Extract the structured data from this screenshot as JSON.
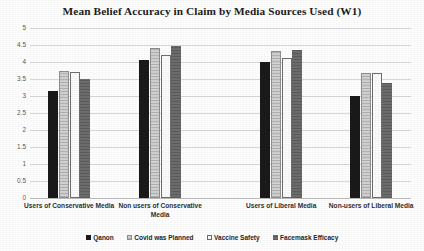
{
  "chart_data": {
    "type": "bar",
    "title": "Mean Belief Accuracy in Claim by Media Sources Used (W1)",
    "xlabel": "",
    "ylabel": "",
    "ylim": [
      0,
      5
    ],
    "ytick_labels": [
      "5",
      "4.5",
      "4",
      "3.5",
      "3",
      "2.5",
      "2",
      "1.5",
      "1",
      "0.5",
      "0"
    ],
    "ytick_values": [
      5,
      4.5,
      4,
      3.5,
      3,
      2.5,
      2,
      1.5,
      1,
      0.5,
      0
    ],
    "grid": true,
    "legend_position": "bottom",
    "categories": [
      "Users of Conservative Media",
      "Non users of Conservative Media",
      "Users of Liberal Media",
      "Non-users of Liberal Media"
    ],
    "series": [
      {
        "name": "Qanon",
        "values": [
          3.15,
          4.07,
          3.99,
          3.01
        ]
      },
      {
        "name": "Covid was Planned",
        "values": [
          3.73,
          4.41,
          4.31,
          3.69
        ]
      },
      {
        "name": "Vaccine Safety",
        "values": [
          3.7,
          4.22,
          4.11,
          3.69
        ]
      },
      {
        "name": "Facemask Efficacy",
        "values": [
          3.49,
          4.48,
          4.36,
          3.38
        ]
      }
    ],
    "colors": {
      "Qanon": "#1a1a1a",
      "Covid was Planned": "#d2d2d2",
      "Vaccine Safety": "#fbfbfb",
      "Facemask Efficacy": "#6e6e6e",
      "gridline": "#d9d9d9",
      "text": "#262626"
    }
  }
}
